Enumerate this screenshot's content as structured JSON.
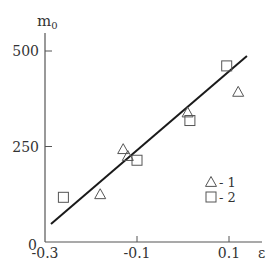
{
  "chart_data": {
    "type": "scatter",
    "title": "",
    "xlabel": "ε",
    "ylabel": "m₀",
    "ylabel_main": "m",
    "ylabel_sub": "0",
    "xlim": [
      -0.3,
      0.15
    ],
    "ylim": [
      0,
      560
    ],
    "x_ticks": [
      -0.3,
      -0.1,
      0.1
    ],
    "x_tick_labels": [
      "-0.3",
      "-0.1",
      "0.1"
    ],
    "y_ticks": [
      0,
      250,
      500
    ],
    "y_tick_labels": [
      "0",
      "250",
      "500"
    ],
    "grid": false,
    "legend_position": "lower-right inside",
    "series": [
      {
        "name": "1",
        "marker": "triangle",
        "legend_label": "- 1",
        "points": [
          {
            "x": -0.18,
            "y": 125
          },
          {
            "x": -0.13,
            "y": 243
          },
          {
            "x": -0.12,
            "y": 225
          },
          {
            "x": 0.01,
            "y": 339
          },
          {
            "x": 0.12,
            "y": 393
          }
        ]
      },
      {
        "name": "2",
        "marker": "square",
        "legend_label": "- 2",
        "points": [
          {
            "x": -0.26,
            "y": 117
          },
          {
            "x": -0.1,
            "y": 214
          },
          {
            "x": 0.015,
            "y": 318
          },
          {
            "x": 0.095,
            "y": 461
          }
        ]
      }
    ],
    "fit_line": {
      "type": "linear",
      "from": {
        "x": -0.287,
        "y": 47
      },
      "to": {
        "x": 0.139,
        "y": 487
      }
    }
  },
  "colors": {
    "axis": "#555555",
    "line": "#1a1a1a",
    "marker": "#555555",
    "text": "#333333"
  }
}
